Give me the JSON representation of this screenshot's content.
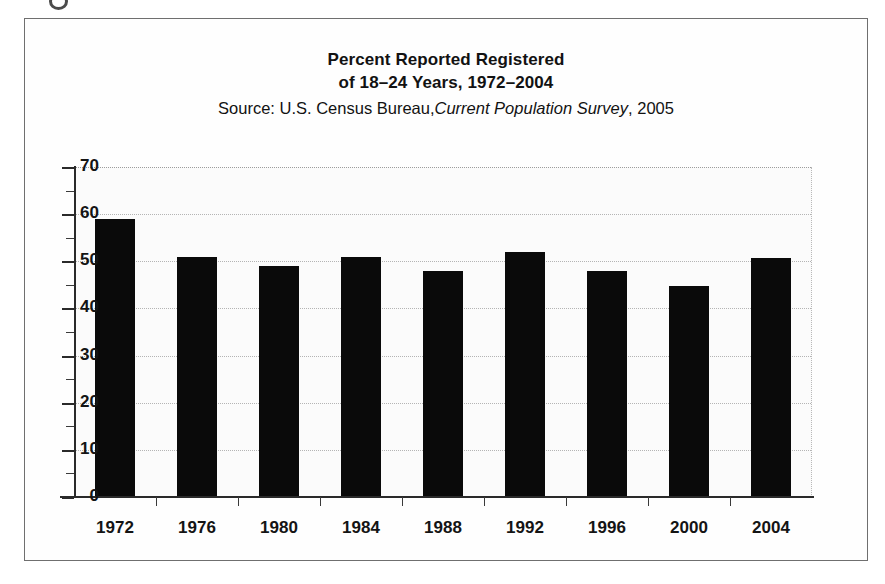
{
  "figure": {
    "title_line_1": "Percent Reported Registered",
    "title_line_2": "of 18–24 Years, 1972–2004",
    "source_prefix": "Source: U.S. Census Bureau,",
    "source_italic": "Current Population Survey",
    "source_suffix": ", 2005",
    "bar_color": "#0a0a0a",
    "grid_color": "#b4b4b4",
    "axis_color": "#2a2a2a",
    "background_color": "#fbfbfb"
  },
  "chart_data": {
    "type": "bar",
    "title": "Percent Reported Registered of 18–24 Years, 1972–2004",
    "subtitle": "Source: U.S. Census Bureau, Current Population Survey, 2005",
    "xlabel": "",
    "ylabel": "",
    "categories": [
      "1972",
      "1976",
      "1980",
      "1984",
      "1988",
      "1992",
      "1996",
      "2000",
      "2004"
    ],
    "values": [
      59,
      51,
      49,
      51,
      48,
      52,
      48,
      44.7,
      50.7
    ],
    "ylim": [
      0,
      70
    ],
    "yticks": [
      0,
      10,
      20,
      30,
      40,
      50,
      60,
      70
    ],
    "ytick_labels": [
      "0",
      "10",
      "20",
      "30",
      "40",
      "50",
      "60",
      "70"
    ],
    "grid": true,
    "grid_axis": "y",
    "legend": false,
    "series": [
      {
        "name": "Percent reported registered",
        "values": [
          59,
          51,
          49,
          51,
          48,
          52,
          48,
          44.7,
          50.7
        ]
      }
    ]
  }
}
